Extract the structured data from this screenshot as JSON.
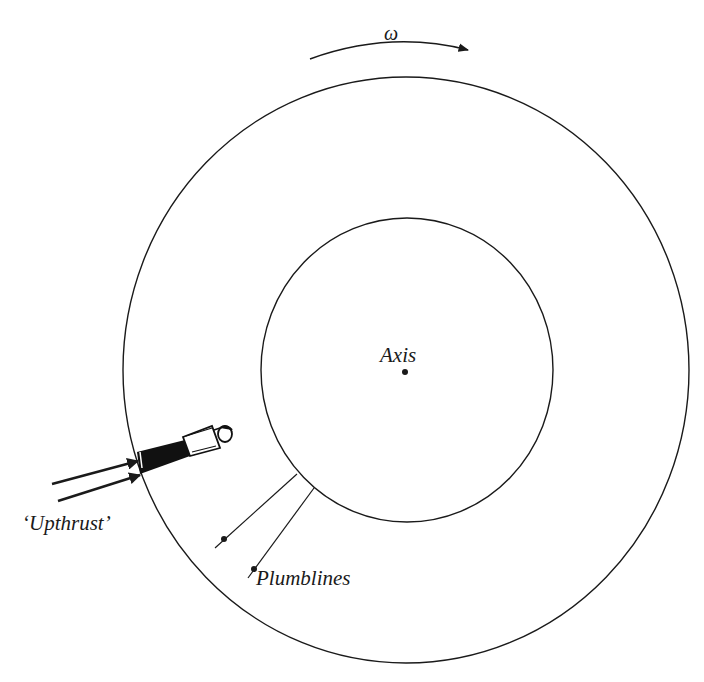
{
  "diagram": {
    "type": "rotating space station cross-section",
    "labels": {
      "omega": "ω",
      "axis": "Axis",
      "upthrust": "‘Upthrust’",
      "plumblines": "Plumblines"
    },
    "elements": {
      "outer_ring": {
        "cx": 406,
        "cy": 370,
        "rx": 283,
        "ry": 293
      },
      "inner_ring": {
        "cx": 407,
        "cy": 370,
        "rx": 146,
        "ry": 152
      },
      "axis_point": {
        "x": 405,
        "y": 372
      },
      "rotation_arrow": {
        "direction": "clockwise",
        "symbol": "ω"
      },
      "person": {
        "position": "standing on inner surface of outer ring, head toward axis"
      },
      "upthrust_arrows": 2,
      "plumblines": 2
    },
    "colors": {
      "stroke": "#1a1a1a",
      "background": "#ffffff"
    }
  }
}
